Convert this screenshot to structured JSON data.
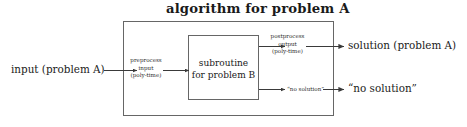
{
  "figure": {
    "title": "algorithm for problem A",
    "outer_box": {
      "label": "algorithm for problem A",
      "x": 123,
      "y": 21,
      "width": 211,
      "height": 95
    },
    "inner_box": {
      "label_line1": "subroutine",
      "label_line2": "for problem B",
      "x": 188,
      "y": 35,
      "width": 71,
      "height": 65
    },
    "input_label": "input (problem A)",
    "preprocess": {
      "line1": "preprocess",
      "line2": "input",
      "line3": "(poly-time)"
    },
    "postprocess": {
      "line1": "postprocess",
      "line2": "output",
      "line3": "(poly-time)"
    },
    "no_solution_inner": "“no solution”",
    "output_solution": "solution (problem A)",
    "output_no_solution": "“no solution”",
    "colors": {
      "stroke": "#555555",
      "text": "#1a1a1a",
      "small_text": "#2b2b2b",
      "background": "#ffffff"
    }
  }
}
